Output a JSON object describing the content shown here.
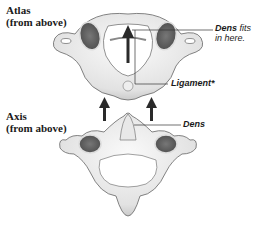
{
  "diagram": {
    "atlas": {
      "title": "Atlas",
      "subtitle": "(from above)"
    },
    "axis": {
      "title": "Axis",
      "subtitle": "(from above)"
    },
    "callouts": {
      "dens_fits_bold": "Dens",
      "dens_fits_rest": " fits",
      "dens_fits_line2": "in here.",
      "ligament": "Ligament*",
      "dens": "Dens"
    },
    "colors": {
      "bone_light": "#f2f2f2",
      "bone_shade": "#bdbdbd",
      "outline": "#555555",
      "arrow": "#2a2a2a",
      "leader_line": "#333333"
    }
  }
}
